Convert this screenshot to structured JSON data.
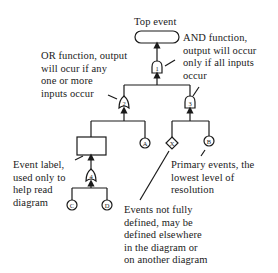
{
  "diagram": {
    "type": "fault-tree",
    "top_event": {
      "label": "Top event"
    },
    "gates": [
      {
        "id": "1",
        "kind": "AND"
      },
      {
        "id": "2",
        "kind": "OR"
      },
      {
        "id": "3",
        "kind": "AND"
      },
      {
        "id": "4",
        "kind": "OR"
      }
    ],
    "primary_events": [
      "A",
      "B",
      "C",
      "D"
    ],
    "undeveloped_events": [
      "X"
    ],
    "annotations": {
      "and_function": "AND function,\noutput will occur\nonly if all inputs\noccur",
      "or_function": "OR function, output\nwill ocur if any\none or more\ninputs occur",
      "event_label": "Event label,\nused only to\nhelp read\ndiagram",
      "primary_events": "Primary events, the\nlowest level of\nresolution",
      "undeveloped": "Events not fully\ndefined, may be\ndefined elsewhere\nin the diagram or\non another diagram"
    }
  }
}
